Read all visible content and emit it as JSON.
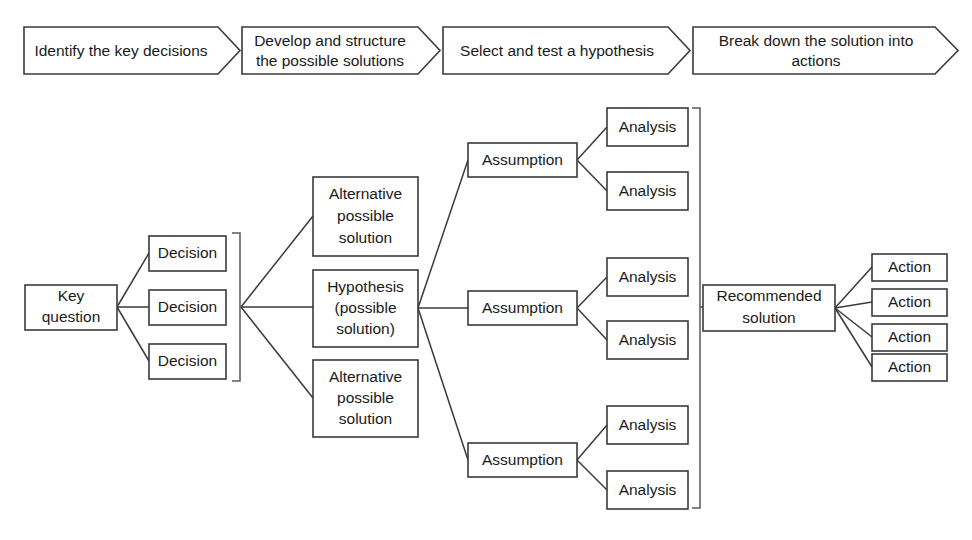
{
  "diagram": {
    "colors": {
      "background": "#ffffff",
      "stroke": "#3a3a3a",
      "bracket": "#5a5a5a",
      "text": "#1a1a1a"
    },
    "process_steps": [
      {
        "label_line1": "Identify the key decisions",
        "label_line2": ""
      },
      {
        "label_line1": "Develop and structure",
        "label_line2": "the possible solutions"
      },
      {
        "label_line1": "Select and test a hypothesis",
        "label_line2": ""
      },
      {
        "label_line1": "Break down the solution into",
        "label_line2": "actions"
      }
    ],
    "root": {
      "line1": "Key",
      "line2": "question"
    },
    "decisions": [
      {
        "label": "Decision"
      },
      {
        "label": "Decision"
      },
      {
        "label": "Decision"
      }
    ],
    "solutions": [
      {
        "line1": "Alternative",
        "line2": "possible",
        "line3": "solution"
      },
      {
        "line1": "Hypothesis",
        "line2": "(possible",
        "line3": "solution)"
      },
      {
        "line1": "Alternative",
        "line2": "possible",
        "line3": "solution"
      }
    ],
    "assumptions": [
      {
        "label": "Assumption"
      },
      {
        "label": "Assumption"
      },
      {
        "label": "Assumption"
      }
    ],
    "analyses": [
      {
        "label": "Analysis"
      },
      {
        "label": "Analysis"
      },
      {
        "label": "Analysis"
      },
      {
        "label": "Analysis"
      },
      {
        "label": "Analysis"
      },
      {
        "label": "Analysis"
      }
    ],
    "recommended": {
      "line1": "Recommended",
      "line2": "solution"
    },
    "actions": [
      {
        "label": "Action"
      },
      {
        "label": "Action"
      },
      {
        "label": "Action"
      },
      {
        "label": "Action"
      }
    ]
  }
}
